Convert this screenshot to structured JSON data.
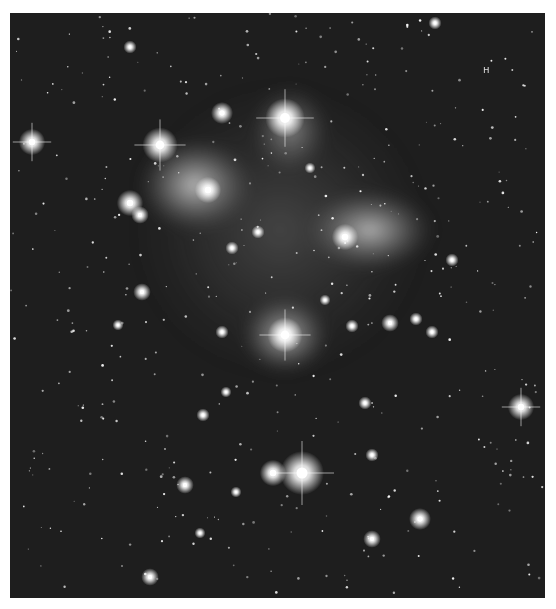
{
  "image": {
    "subject": "Pleiades star cluster with reflection nebula",
    "background_color": "#ffffff",
    "sky_color": "#1e1e1e",
    "frame": {
      "x": 10,
      "y": 13,
      "width": 535,
      "height": 585
    },
    "nebulae": [
      {
        "cx": 195,
        "cy": 185,
        "rx": 58,
        "ry": 48,
        "opacity": 0.75
      },
      {
        "cx": 370,
        "cy": 230,
        "rx": 65,
        "ry": 42,
        "opacity": 0.7
      },
      {
        "cx": 285,
        "cy": 335,
        "rx": 45,
        "ry": 40,
        "opacity": 0.7
      },
      {
        "cx": 290,
        "cy": 130,
        "rx": 40,
        "ry": 45,
        "opacity": 0.45
      },
      {
        "cx": 280,
        "cy": 230,
        "rx": 150,
        "ry": 150,
        "opacity": 0.18
      }
    ],
    "bright_stars": [
      {
        "x": 285,
        "y": 118,
        "r": 9,
        "spikes": true
      },
      {
        "x": 160,
        "y": 145,
        "r": 8,
        "spikes": true
      },
      {
        "x": 222,
        "y": 113,
        "r": 5,
        "spikes": false
      },
      {
        "x": 130,
        "y": 203,
        "r": 6,
        "spikes": false
      },
      {
        "x": 140,
        "y": 215,
        "r": 4,
        "spikes": false
      },
      {
        "x": 32,
        "y": 142,
        "r": 6,
        "spikes": true
      },
      {
        "x": 208,
        "y": 190,
        "r": 6,
        "spikes": false
      },
      {
        "x": 345,
        "y": 237,
        "r": 6,
        "spikes": false
      },
      {
        "x": 285,
        "y": 335,
        "r": 8,
        "spikes": true
      },
      {
        "x": 302,
        "y": 473,
        "r": 10,
        "spikes": true
      },
      {
        "x": 273,
        "y": 473,
        "r": 6,
        "spikes": false
      },
      {
        "x": 521,
        "y": 407,
        "r": 6,
        "spikes": true
      },
      {
        "x": 420,
        "y": 519,
        "r": 5,
        "spikes": false
      },
      {
        "x": 142,
        "y": 292,
        "r": 4,
        "spikes": false
      },
      {
        "x": 185,
        "y": 485,
        "r": 4,
        "spikes": false
      },
      {
        "x": 372,
        "y": 539,
        "r": 4,
        "spikes": false
      },
      {
        "x": 150,
        "y": 577,
        "r": 4,
        "spikes": false
      },
      {
        "x": 390,
        "y": 323,
        "r": 4,
        "spikes": false
      },
      {
        "x": 416,
        "y": 319,
        "r": 3,
        "spikes": false
      },
      {
        "x": 432,
        "y": 332,
        "r": 3,
        "spikes": false
      },
      {
        "x": 352,
        "y": 326,
        "r": 3,
        "spikes": false
      },
      {
        "x": 203,
        "y": 415,
        "r": 3,
        "spikes": false
      },
      {
        "x": 372,
        "y": 455,
        "r": 3,
        "spikes": false
      },
      {
        "x": 452,
        "y": 260,
        "r": 3,
        "spikes": false
      },
      {
        "x": 130,
        "y": 47,
        "r": 3,
        "spikes": false
      },
      {
        "x": 232,
        "y": 248,
        "r": 3,
        "spikes": false
      },
      {
        "x": 258,
        "y": 232,
        "r": 3,
        "spikes": false
      },
      {
        "x": 222,
        "y": 332,
        "r": 3,
        "spikes": false
      },
      {
        "x": 435,
        "y": 23,
        "r": 3,
        "spikes": false
      },
      {
        "x": 365,
        "y": 403,
        "r": 3,
        "spikes": false
      },
      {
        "x": 236,
        "y": 492,
        "r": 2.5,
        "spikes": false
      },
      {
        "x": 200,
        "y": 533,
        "r": 2.5,
        "spikes": false
      },
      {
        "x": 118,
        "y": 325,
        "r": 2.5,
        "spikes": false
      },
      {
        "x": 310,
        "y": 168,
        "r": 2.5,
        "spikes": false
      },
      {
        "x": 325,
        "y": 300,
        "r": 2.5,
        "spikes": false
      },
      {
        "x": 226,
        "y": 392,
        "r": 2.5,
        "spikes": false
      }
    ],
    "faint_star_count": 420,
    "plate_mark": {
      "x": 483,
      "y": 73,
      "text": "ʜ"
    }
  }
}
